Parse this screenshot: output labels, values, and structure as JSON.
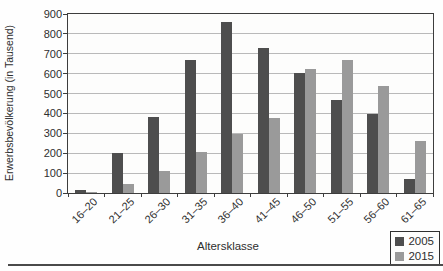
{
  "chart_data": {
    "type": "bar",
    "title": "",
    "xlabel": "Altersklasse",
    "ylabel": "Erwerbsbevölkerung (in Tausend)",
    "categories": [
      "16–20",
      "21–25",
      "26–30",
      "31–35",
      "36–40",
      "41–45",
      "46–50",
      "51–55",
      "56–60",
      "61–65"
    ],
    "series": [
      {
        "name": "2005",
        "color": "#4e4e4e",
        "values": [
          15,
          200,
          380,
          670,
          860,
          730,
          605,
          470,
          395,
          70
        ]
      },
      {
        "name": "2015",
        "color": "#9a9a9a",
        "values": [
          5,
          45,
          110,
          205,
          295,
          375,
          625,
          670,
          540,
          260
        ]
      }
    ],
    "ylim": [
      0,
      900
    ],
    "yticks": [
      0,
      100,
      200,
      300,
      400,
      500,
      600,
      700,
      800,
      900
    ],
    "grid": true,
    "legend_position": "bottom-right"
  },
  "colors": {
    "bar_2005": "#4e4e4e",
    "bar_2015": "#9a9a9a",
    "gridline": "#b9b9b9",
    "axis": "#3d3d3d",
    "text": "#2e2e2e",
    "bottom_rule": "#4a4a4a",
    "background": "#fefefe"
  }
}
